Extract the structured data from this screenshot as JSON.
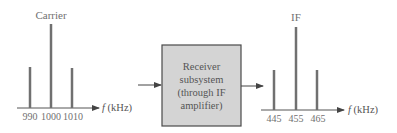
{
  "input_spectrum": {
    "title": "Carrier",
    "axis_label_italic": "f",
    "axis_label_unit": " (kHz)",
    "ticks": [
      "990",
      "1000",
      "1010"
    ],
    "lines": [
      {
        "freq": 990,
        "role": "lower sideband",
        "rel_height": 0.47
      },
      {
        "freq": 1000,
        "role": "carrier",
        "rel_height": 1.0
      },
      {
        "freq": 1010,
        "role": "upper sideband",
        "rel_height": 0.47
      }
    ]
  },
  "block": {
    "lines": [
      "Receiver",
      "subsystem",
      "(through IF",
      "amplifier)"
    ],
    "fill": "#d4d4d4",
    "border": "#4a4a4a"
  },
  "output_spectrum": {
    "title": "IF",
    "axis_label_italic": "f",
    "axis_label_unit": " (kHz)",
    "ticks": [
      "445",
      "455",
      "465"
    ],
    "lines": [
      {
        "freq": 445,
        "role": "lower sideband",
        "rel_height": 0.47
      },
      {
        "freq": 455,
        "role": "IF carrier",
        "rel_height": 1.0
      },
      {
        "freq": 465,
        "role": "upper sideband",
        "rel_height": 0.47
      }
    ]
  },
  "colors": {
    "line": "#707070",
    "axis": "#555555",
    "text": "#707070"
  }
}
